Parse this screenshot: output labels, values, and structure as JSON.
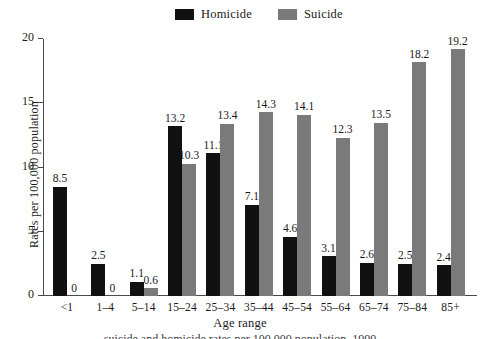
{
  "chart_data": {
    "type": "bar",
    "title": "",
    "xlabel": "Age range",
    "ylabel": "Rates per 100,000 population",
    "ylim": [
      0,
      20
    ],
    "yticks": [
      0,
      5,
      10,
      15,
      20
    ],
    "grid": false,
    "legend_position": "top-center",
    "categories": [
      "<1",
      "1–4",
      "5–14",
      "15–24",
      "25–34",
      "35–44",
      "45–54",
      "55–64",
      "65–74",
      "75–84",
      "85+"
    ],
    "series": [
      {
        "name": "Homicide",
        "color": "#111111",
        "values": [
          8.5,
          2.5,
          1.1,
          13.2,
          11.1,
          7.1,
          4.6,
          3.1,
          2.6,
          2.5,
          2.4
        ],
        "labels": [
          "8.5",
          "2.5",
          "1.1",
          "13.2",
          "11.1",
          "7.1",
          "4.6",
          "3.1",
          "2.6",
          "2.5",
          "2.4"
        ]
      },
      {
        "name": "Suicide",
        "color": "#7a7a7a",
        "values": [
          0,
          0,
          0.6,
          10.3,
          13.4,
          14.3,
          14.1,
          12.3,
          13.5,
          18.2,
          19.2
        ],
        "labels": [
          "0",
          "0",
          "0.6",
          "10.3",
          "13.4",
          "14.3",
          "14.1",
          "12.3",
          "13.5",
          "18.2",
          "19.2"
        ]
      }
    ]
  },
  "legend": {
    "entries": [
      {
        "label": "Homicide",
        "color": "#111111"
      },
      {
        "label": "Suicide",
        "color": "#7a7a7a"
      }
    ]
  },
  "axes": {
    "y_title": "Rates per 100,000 population",
    "x_title": "Age range",
    "y_tick_labels": [
      "20",
      "15",
      "10",
      "5",
      "0"
    ]
  },
  "caption": {
    "text": "suicide and homicide rates per 100,000 population, 1999"
  }
}
